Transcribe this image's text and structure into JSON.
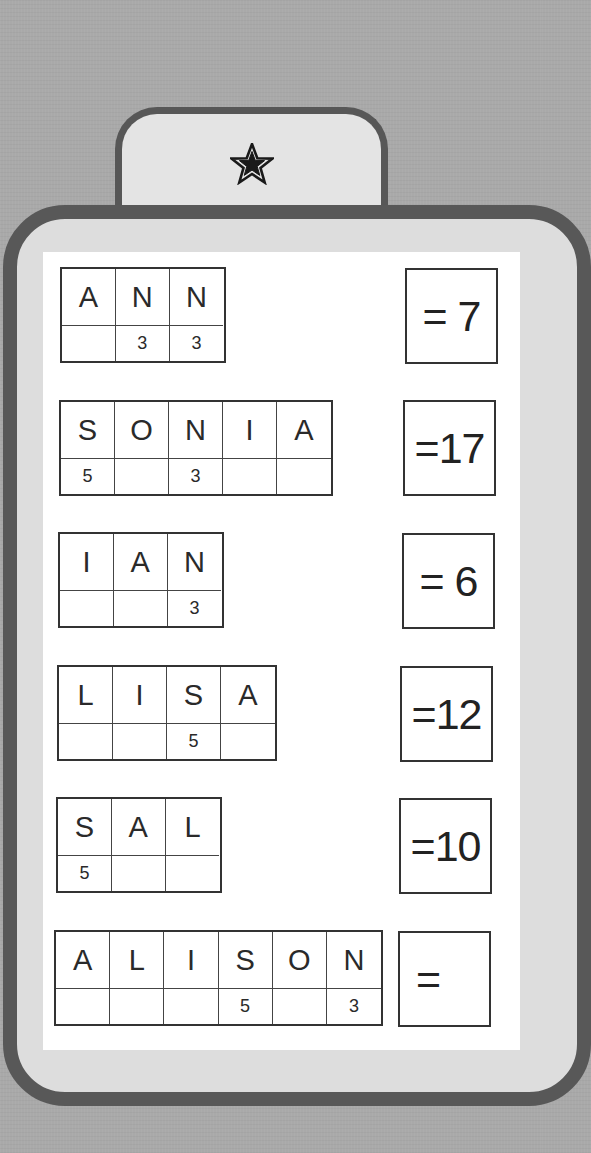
{
  "tab": {
    "icon": "star-icon"
  },
  "rows": [
    {
      "letters": [
        "A",
        "N",
        "N"
      ],
      "points": [
        "",
        "3",
        "3"
      ],
      "answer": "= 7"
    },
    {
      "letters": [
        "S",
        "O",
        "N",
        "I",
        "A"
      ],
      "points": [
        "5",
        "",
        "3",
        "",
        ""
      ],
      "answer": "=17"
    },
    {
      "letters": [
        "I",
        "A",
        "N"
      ],
      "points": [
        "",
        "",
        "3"
      ],
      "answer": "= 6"
    },
    {
      "letters": [
        "L",
        "I",
        "S",
        "A"
      ],
      "points": [
        "",
        "",
        "5",
        ""
      ],
      "answer": "=12"
    },
    {
      "letters": [
        "S",
        "A",
        "L"
      ],
      "points": [
        "5",
        "",
        ""
      ],
      "answer": "=10"
    },
    {
      "letters": [
        "A",
        "L",
        "I",
        "S",
        "O",
        "N"
      ],
      "points": [
        "",
        "",
        "",
        "5",
        "",
        "3"
      ],
      "answer": "="
    }
  ],
  "colors": {
    "background": "#a9a9a9",
    "border": "#585858",
    "card": "#dddddd",
    "panel": "#ffffff"
  }
}
